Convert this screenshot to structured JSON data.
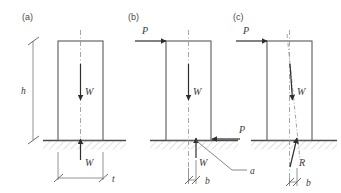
{
  "figure": {
    "background_color": "#ffffff",
    "line_color": "#5a5a5a",
    "arrow_color": "#2e2e2e",
    "hatch_color": "#9a9a9a"
  },
  "panels": [
    {
      "id": "a",
      "label": "(a)",
      "labels": {
        "weight": "W",
        "reaction": "W",
        "height": "h",
        "width": "t"
      }
    },
    {
      "id": "b",
      "label": "(b)",
      "labels": {
        "applied_top": "P",
        "applied_bottom": "P",
        "weight": "W",
        "reaction": "W",
        "offset": "b",
        "pivot": "a"
      }
    },
    {
      "id": "c",
      "label": "(c)",
      "labels": {
        "applied_top": "P",
        "weight": "W",
        "reaction": "R",
        "offset": "b"
      }
    }
  ]
}
